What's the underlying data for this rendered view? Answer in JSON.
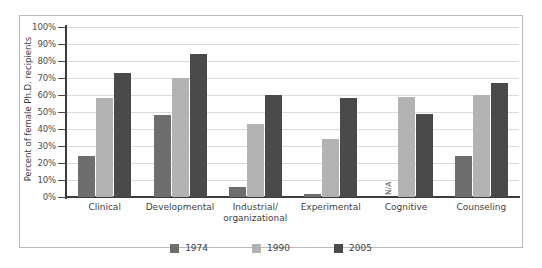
{
  "chart_data": {
    "type": "bar",
    "title": "",
    "xlabel": "",
    "ylabel": "Percent of female Ph.D. recipients",
    "ylim": [
      0,
      100
    ],
    "ytick_labels": [
      "100%",
      "90%",
      "80%",
      "70%",
      "60%",
      "50%",
      "40%",
      "30%",
      "20%",
      "10%",
      "0%"
    ],
    "ytick_values": [
      100,
      90,
      80,
      70,
      60,
      50,
      40,
      30,
      20,
      10,
      0
    ],
    "grid": true,
    "legend_position": "bottom",
    "categories": [
      "Clinical",
      "Developmental",
      "Industrial/ organizational",
      "Experimental",
      "Cognitive",
      "Counseling"
    ],
    "category_lines": [
      [
        "Clinical"
      ],
      [
        "Developmental"
      ],
      [
        "Industrial/",
        "organizational"
      ],
      [
        "Experimental"
      ],
      [
        "Cognitive"
      ],
      [
        "Counseling"
      ]
    ],
    "series": [
      {
        "name": "1974",
        "color": "#6e6e6e",
        "values": [
          24,
          48,
          6,
          2,
          null,
          24
        ],
        "value_labels": [
          "24%",
          "48%",
          "6%",
          "2%",
          "N/A",
          "24%"
        ]
      },
      {
        "name": "1990",
        "color": "#b3b3b3",
        "values": [
          58,
          70,
          43,
          34,
          59,
          60
        ],
        "value_labels": [
          "58%",
          "70%",
          "43%",
          "34%",
          "59%",
          "60%"
        ]
      },
      {
        "name": "2005",
        "color": "#4a4a4a",
        "values": [
          73,
          84,
          60,
          58,
          49,
          67
        ],
        "value_labels": [
          "73%",
          "84%",
          "60%",
          "58%",
          "49%",
          "67%"
        ]
      }
    ],
    "missing_label": "N/A",
    "missing_note": "Cognitive 1974 data not available"
  },
  "legend": {
    "items": [
      {
        "label": "1974",
        "color": "#6e6e6e"
      },
      {
        "label": "1990",
        "color": "#b3b3b3"
      },
      {
        "label": "2005",
        "color": "#4a4a4a"
      }
    ]
  }
}
